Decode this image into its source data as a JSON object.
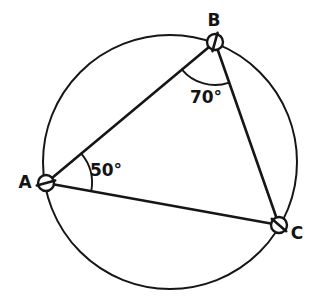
{
  "figure": {
    "background_color": "#ffffff",
    "ink_color": "#161616",
    "width": 319,
    "height": 299
  },
  "circle": {
    "name": "circumscribed-circle",
    "cx": 170,
    "cy": 162,
    "r": 127
  },
  "vertices": [
    {
      "id": "A",
      "label": "A",
      "x": 46,
      "y": 183,
      "marker_r": 8,
      "label_x": 25,
      "label_y": 183
    },
    {
      "id": "B",
      "label": "B",
      "x": 215,
      "y": 42,
      "marker_r": 8,
      "label_x": 214,
      "label_y": 21
    },
    {
      "id": "C",
      "label": "C",
      "x": 279,
      "y": 225,
      "marker_r": 8,
      "label_x": 297,
      "label_y": 234
    }
  ],
  "chords": [
    {
      "id": "AB",
      "from": "A",
      "to": "B"
    },
    {
      "id": "BC",
      "from": "B",
      "to": "C"
    },
    {
      "id": "AC",
      "from": "A",
      "to": "C"
    }
  ],
  "angles": [
    {
      "id": "angle-A",
      "vertex": "A",
      "value": 50,
      "label": "50°",
      "label_x": 106,
      "label_y": 171,
      "arc_radius": 46
    },
    {
      "id": "angle-B",
      "vertex": "B",
      "value": 70,
      "label": "70°",
      "label_x": 206,
      "label_y": 98,
      "arc_radius": 43
    }
  ]
}
